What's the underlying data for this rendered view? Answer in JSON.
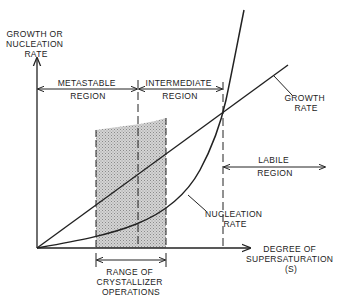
{
  "diagram": {
    "y_axis_label": [
      "GROWTH OR",
      "NUCLEATION",
      "RATE"
    ],
    "x_axis_label": [
      "DEGREE OF",
      "SUPERSATURATION",
      "(S)"
    ],
    "regions": {
      "metastable": [
        "METASTABLE",
        "REGION"
      ],
      "intermediate": [
        "INTERMEDIATE",
        "REGION"
      ],
      "labile": [
        "LABILE",
        "REGION"
      ]
    },
    "curves": {
      "growth_rate": [
        "GROWTH",
        "RATE"
      ],
      "nucleation_rate": [
        "NUCLEATION",
        "RATE"
      ]
    },
    "operating_range": [
      "RANGE OF",
      "CRYSTALLIZER",
      "OPERATIONS"
    ],
    "colors": {
      "line": "#222222",
      "shading": "#bdbdbd",
      "background": "#ffffff"
    }
  }
}
